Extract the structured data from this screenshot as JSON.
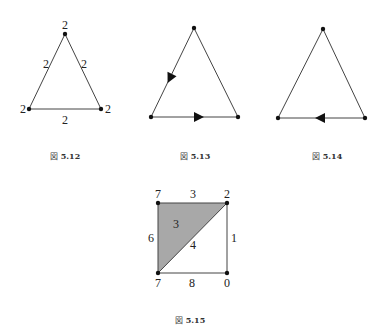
{
  "figures": [
    {
      "id": "fig-5-12",
      "caption_prefix": "図",
      "caption_number": "5.12",
      "vertices": [
        {
          "x": 65,
          "y": 34,
          "label": "2"
        },
        {
          "x": 29,
          "y": 109,
          "label": "2"
        },
        {
          "x": 101,
          "y": 109,
          "label": "2"
        }
      ],
      "edge_labels": {
        "left": "2",
        "right": "2",
        "bottom": "2"
      }
    },
    {
      "id": "fig-5-13",
      "caption_prefix": "図",
      "caption_number": "5.13",
      "vertices": [
        {
          "x": 194,
          "y": 28
        },
        {
          "x": 151,
          "y": 117
        },
        {
          "x": 238,
          "y": 117
        }
      ],
      "arrows": [
        {
          "edge": "left",
          "direction": "top-to-bottom-left"
        },
        {
          "edge": "bottom",
          "direction": "left-to-right"
        }
      ]
    },
    {
      "id": "fig-5-14",
      "caption_prefix": "図",
      "caption_number": "5.14",
      "vertices": [
        {
          "x": 323,
          "y": 29
        },
        {
          "x": 278,
          "y": 118
        },
        {
          "x": 365,
          "y": 118
        }
      ],
      "arrows": [
        {
          "edge": "bottom",
          "direction": "right-to-left"
        }
      ]
    },
    {
      "id": "fig-5-15",
      "caption_prefix": "図",
      "caption_number": "5.15",
      "shaded_color": "#a8a8a8",
      "vertex_labels": {
        "top_left": "7",
        "top_right": "2",
        "bottom_left": "7",
        "bottom_right": "0"
      },
      "edge_labels": {
        "top": "3",
        "left": "6",
        "right": "1",
        "bottom": "8",
        "diagonal": "4"
      },
      "face_labels": {
        "shaded_triangle": "3"
      }
    }
  ]
}
